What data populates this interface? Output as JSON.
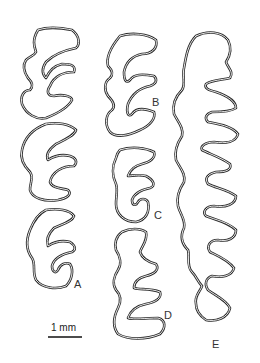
{
  "figure": {
    "panels": [
      {
        "id": "A",
        "label": "A"
      },
      {
        "id": "B",
        "label": "B"
      },
      {
        "id": "C",
        "label": "C"
      },
      {
        "id": "D",
        "label": "D"
      },
      {
        "id": "E",
        "label": "E"
      }
    ],
    "scale_bar": {
      "label": "1 mm"
    },
    "colors": {
      "line": "#2a2a2a",
      "background": "#ffffff"
    }
  }
}
